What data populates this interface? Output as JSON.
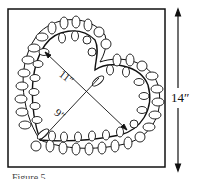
{
  "figure": {
    "type": "quilting pattern diagram",
    "labels": {
      "block_size": "14″",
      "heart_long_axis": "11″",
      "heart_short_axis": "9″"
    },
    "caption": "Figure 5"
  }
}
